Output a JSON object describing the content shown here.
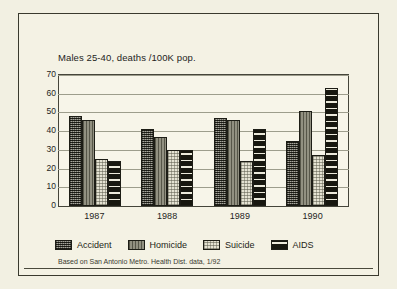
{
  "chart_data": {
    "type": "bar",
    "title": "Males 25-40, deaths /100K pop.",
    "xlabel": "",
    "ylabel": "",
    "ylim": [
      0,
      70
    ],
    "ytick_step": 10,
    "yticks": [
      "70",
      "60",
      "50",
      "40",
      "30",
      "20",
      "10",
      "0"
    ],
    "grid": true,
    "legend_position": "bottom",
    "categories": [
      "1987",
      "1988",
      "1989",
      "1990"
    ],
    "series": [
      {
        "name": "Accident",
        "values": [
          48,
          41,
          47,
          35
        ],
        "pattern": "dark-crosshatch",
        "color": "#5b5a4c"
      },
      {
        "name": "Homicide",
        "values": [
          46,
          37,
          46,
          51
        ],
        "pattern": "medium-gray",
        "color": "#7d7c6c"
      },
      {
        "name": "Suicide",
        "values": [
          25,
          30,
          24,
          27
        ],
        "pattern": "light-dots",
        "color": "#e4e2d2"
      },
      {
        "name": "AIDS",
        "values": [
          24,
          30,
          41,
          63
        ],
        "pattern": "black-horizontal-stripes",
        "color": "#17170f"
      }
    ],
    "footnote": "Based on San Antonio Metro. Health Dist. data, 1/92"
  },
  "colors": {
    "page_background": "#f2f0e2",
    "plot_background": "#f7f5e9",
    "frame": "#3a3a2e",
    "gridline": "#9d9d8c",
    "text": "#24241c"
  }
}
